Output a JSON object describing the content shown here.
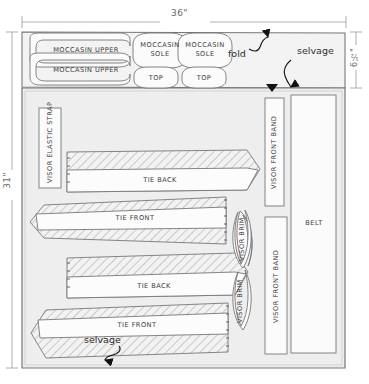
{
  "diagram": {
    "dimensions": {
      "width_label": "36\"",
      "height_label": "31\"",
      "top_band_height_label": "6½\""
    },
    "annotations": [
      {
        "id": "fold",
        "text": "fold"
      },
      {
        "id": "selvage-top",
        "text": "selvage"
      },
      {
        "id": "selvage-bottom",
        "text": "selvage"
      }
    ],
    "pieces": {
      "moccasin_upper_1": "MOCCASIN UPPER",
      "moccasin_upper_2": "MOCCASIN UPPER",
      "moccasin_sole_1_l1": "MOCCASIN",
      "moccasin_sole_1_l2": "SOLE",
      "moccasin_sole_2_l1": "MOCCASIN",
      "moccasin_sole_2_l2": "SOLE",
      "top_1": "TOP",
      "top_2": "TOP",
      "visor_elastic_strap": "VISOR ELASTIC STRAP",
      "tie_back_1": "TIE BACK",
      "tie_front_1": "TIE FRONT",
      "tie_back_2": "TIE BACK",
      "tie_front_2": "TIE FRONT",
      "visor_brim_1": "VISOR BRIM",
      "visor_brim_2": "VISOR BRIM",
      "visor_front_band_1": "VISOR FRONT BAND",
      "visor_front_band_2": "VISOR FRONT BAND",
      "belt": "BELT"
    },
    "colors": {
      "fabric_fill": "#efefef",
      "piece_fill": "#fbfbfb",
      "hatch_stroke": "#9a9a9a",
      "outline": "#6f6f6f",
      "dimension": "#8a8a8a",
      "text": "#3a3a3a"
    }
  }
}
